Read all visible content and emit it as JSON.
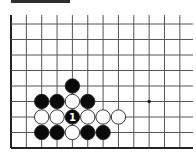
{
  "diagram": {
    "title_bar": "",
    "board": {
      "visible_columns": 12,
      "visible_rows": 9,
      "open_edges": [
        "top",
        "right"
      ],
      "closed_edges": [
        "left",
        "bottom"
      ],
      "star_points": [
        {
          "col": 9,
          "row": 5
        }
      ],
      "stones": [
        {
          "col": 4,
          "row": 4,
          "color": "black",
          "label": ""
        },
        {
          "col": 2,
          "row": 5,
          "color": "black",
          "label": ""
        },
        {
          "col": 3,
          "row": 5,
          "color": "black",
          "label": ""
        },
        {
          "col": 4,
          "row": 5,
          "color": "white",
          "label": ""
        },
        {
          "col": 5,
          "row": 5,
          "color": "black",
          "label": ""
        },
        {
          "col": 2,
          "row": 6,
          "color": "white",
          "label": ""
        },
        {
          "col": 3,
          "row": 6,
          "color": "white",
          "label": ""
        },
        {
          "col": 4,
          "row": 6,
          "color": "black",
          "label": "1"
        },
        {
          "col": 5,
          "row": 6,
          "color": "white",
          "label": ""
        },
        {
          "col": 6,
          "row": 6,
          "color": "white",
          "label": ""
        },
        {
          "col": 7,
          "row": 6,
          "color": "white",
          "label": ""
        },
        {
          "col": 2,
          "row": 7,
          "color": "black",
          "label": ""
        },
        {
          "col": 3,
          "row": 7,
          "color": "black",
          "label": ""
        },
        {
          "col": 4,
          "row": 7,
          "color": "white",
          "label": ""
        },
        {
          "col": 5,
          "row": 7,
          "color": "black",
          "label": ""
        },
        {
          "col": 6,
          "row": 7,
          "color": "black",
          "label": ""
        }
      ]
    },
    "colors": {
      "background": "#ffffff",
      "line": "#555555",
      "edge": "#222222",
      "black_stone": "#0a0a0a",
      "white_stone": "#ffffff",
      "title_bar": "#2e2e2e"
    }
  }
}
